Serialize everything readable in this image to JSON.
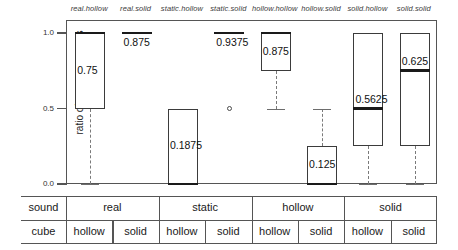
{
  "chart_data": {
    "type": "box",
    "title": "",
    "xlabel": "",
    "ylabel": "ratio of correct answers",
    "ylim": [
      0.0,
      1.0
    ],
    "yticks": [
      "1.0",
      "0.5",
      "0.0"
    ],
    "ytick_values": [
      1.0,
      0.5,
      0.0
    ],
    "grid": false,
    "legend": "none",
    "categories": [
      "real.hollow",
      "real.solid",
      "static.hollow",
      "static.solid",
      "hollow.hollow",
      "hollow.solid",
      "solid.hollow",
      "solid.solid"
    ],
    "boxes": [
      {
        "label": "real.hollow",
        "value_label": "0.75",
        "median": 1.0,
        "q1": 0.5,
        "q3": 1.0,
        "whisker_low": 0.0,
        "whisker_high": 1.0,
        "outliers": []
      },
      {
        "label": "real.solid",
        "value_label": "0.875",
        "median": 1.0,
        "q1": 1.0,
        "q3": 1.0,
        "whisker_low": 1.0,
        "whisker_high": 1.0,
        "outliers": []
      },
      {
        "label": "static.hollow",
        "value_label": "0.1875",
        "median": 0.0,
        "q1": 0.0,
        "q3": 0.5,
        "whisker_low": 0.0,
        "whisker_high": 0.5,
        "outliers": []
      },
      {
        "label": "static.solid",
        "value_label": "0.9375",
        "median": 1.0,
        "q1": 1.0,
        "q3": 1.0,
        "whisker_low": 1.0,
        "whisker_high": 1.0,
        "outliers": [
          0.5
        ]
      },
      {
        "label": "hollow.hollow",
        "value_label": "0.875",
        "median": 1.0,
        "q1": 0.75,
        "q3": 1.0,
        "whisker_low": 0.5,
        "whisker_high": 1.0,
        "outliers": []
      },
      {
        "label": "hollow.solid",
        "value_label": "0.125",
        "median": 0.0,
        "q1": 0.0,
        "q3": 0.25,
        "whisker_low": 0.0,
        "whisker_high": 0.5,
        "outliers": []
      },
      {
        "label": "solid.hollow",
        "value_label": "0.5625",
        "median": 0.5,
        "q1": 0.25,
        "q3": 1.0,
        "whisker_low": 0.0,
        "whisker_high": 1.0,
        "outliers": []
      },
      {
        "label": "solid.solid",
        "value_label": "0.625",
        "median": 0.75,
        "q1": 0.25,
        "q3": 1.0,
        "whisker_low": 0.0,
        "whisker_high": 1.0,
        "outliers": []
      }
    ]
  },
  "table": {
    "row_sound_label": "sound",
    "row_cube_label": "cube",
    "sound_groups": [
      "real",
      "static",
      "hollow",
      "solid"
    ],
    "cube_cells": [
      "hollow",
      "solid",
      "hollow",
      "solid",
      "hollow",
      "solid",
      "hollow",
      "solid"
    ]
  }
}
